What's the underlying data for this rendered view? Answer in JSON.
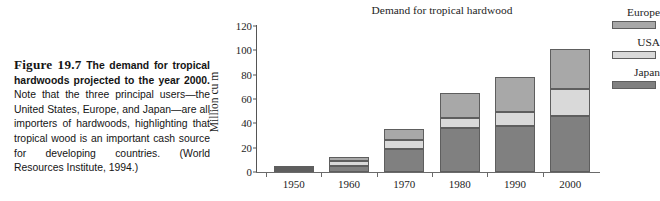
{
  "figure": {
    "number_label": "Figure 19.7",
    "title_bold": "The demand for tropical hardwoods projected to the year 2000.",
    "body_text": " Note that the three principal users—the United States, Europe, and Japan—are all importers of hardwoods, highlighting that tropical wood is an important cash source for developing countries. (World Resources Institute, 1994.)"
  },
  "chart_data": {
    "type": "bar",
    "subtype": "stacked",
    "title": "Demand for tropical hardwood",
    "xlabel": "",
    "ylabel": "Million cu m",
    "categories": [
      "1950",
      "1960",
      "1970",
      "1980",
      "1990",
      "2000"
    ],
    "ylim": [
      0,
      120
    ],
    "yticks": [
      0,
      20,
      40,
      60,
      80,
      100,
      120
    ],
    "ytick_labels": [
      "0",
      "20",
      "40",
      "60",
      "80",
      "100",
      "120"
    ],
    "grid": false,
    "legend_position": "right",
    "series": [
      {
        "name": "Japan",
        "color": "#808080",
        "values": [
          2,
          5,
          19,
          36,
          38,
          46
        ]
      },
      {
        "name": "USA",
        "color": "#d9d9d9",
        "values": [
          1,
          4,
          7,
          8,
          11,
          22
        ]
      },
      {
        "name": "Europe",
        "color": "#a8a8a8",
        "values": [
          1,
          3,
          9,
          21,
          29,
          33
        ]
      }
    ],
    "totals": [
      4,
      12,
      35,
      65,
      78,
      101
    ],
    "legend_order": [
      "Europe",
      "USA",
      "Japan"
    ],
    "source_note": "World Resources Institute, 1994"
  },
  "colors": {
    "japan": "#808080",
    "usa": "#d9d9d9",
    "europe": "#a8a8a8",
    "outline": "#5e5e5e",
    "axis": "#6a6a6a",
    "text": "#1d1d1d",
    "background": "#ffffff"
  }
}
